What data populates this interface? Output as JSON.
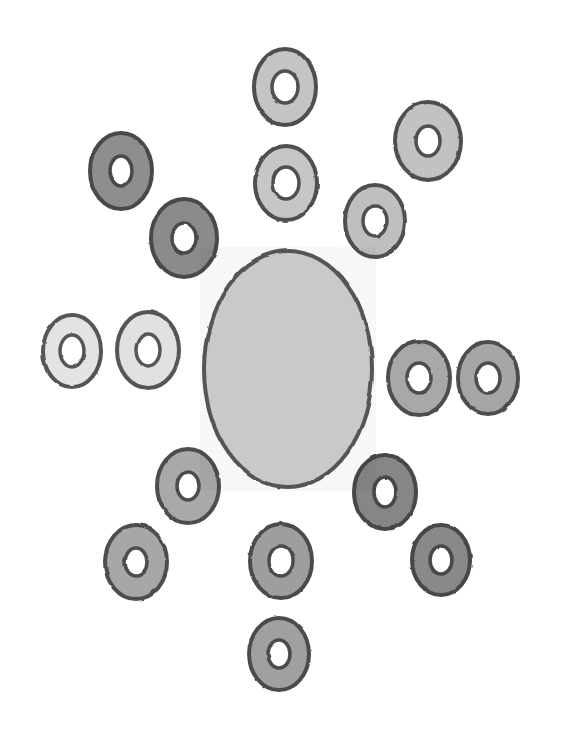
{
  "figure": {
    "medium": "hand-drawn pencil sketch",
    "background_color": "#ffffff",
    "canvas": {
      "width": 574,
      "height": 737
    },
    "stroke_color": "#5a5a5a",
    "hole_color": "#ffffff"
  },
  "chart_data": {
    "type": "scatter",
    "xlabel": "",
    "ylabel": "",
    "xlim": [
      0,
      574
    ],
    "ylim": [
      0,
      737
    ],
    "grid": false,
    "legend": "none",
    "annotations": [],
    "categories": [
      "central-disc",
      "ring-top",
      "ring-top-inner",
      "ring-upper-right-outer",
      "ring-upper-right-inner",
      "ring-upper-left-outer",
      "ring-upper-left-inner",
      "ring-left-outer",
      "ring-left-inner",
      "ring-right-inner",
      "ring-right-outer",
      "ring-lower-left-inner",
      "ring-lower-left-outer",
      "ring-bottom-inner",
      "ring-bottom-outer",
      "ring-lower-right-inner",
      "ring-lower-right-outer"
    ],
    "series": [
      {
        "name": "center_x",
        "values": [
          288,
          285,
          286,
          428,
          375,
          121,
          184,
          72,
          148,
          419,
          488,
          188,
          136,
          281,
          279,
          385,
          441
        ]
      },
      {
        "name": "center_y",
        "values": [
          369,
          87,
          183,
          141,
          221,
          171,
          238,
          351,
          350,
          378,
          378,
          486,
          562,
          561,
          654,
          492,
          560
        ]
      },
      {
        "name": "outer_radius",
        "values": [
          84,
          31,
          31,
          33,
          30,
          31,
          33,
          29,
          31,
          31,
          30,
          31,
          31,
          31,
          30,
          31,
          29
        ]
      },
      {
        "name": "hole_radius",
        "values": [
          0,
          13,
          13,
          12,
          12,
          11,
          12,
          12,
          12,
          12,
          12,
          11,
          11,
          12,
          11,
          11,
          11
        ]
      }
    ]
  },
  "shapes": {
    "core": {
      "name": "central-disc",
      "cx": 288,
      "cy": 369,
      "rx": 84,
      "ry": 118,
      "fill": "#c9c9c9",
      "stroke": "#555555",
      "stroke_width": 4
    },
    "rings": [
      {
        "name": "ring-top",
        "cx": 285,
        "cy": 87,
        "rx": 31,
        "ry": 38,
        "hole_rx": 13,
        "hole_ry": 16,
        "fill": "#c4c4c4",
        "stroke": "#4f4f4f",
        "stroke_width": 4,
        "tone": "light"
      },
      {
        "name": "ring-top-inner",
        "cx": 286,
        "cy": 183,
        "rx": 31,
        "ry": 37,
        "hole_rx": 13,
        "hole_ry": 16,
        "fill": "#c6c6c6",
        "stroke": "#4f4f4f",
        "stroke_width": 4,
        "tone": "light"
      },
      {
        "name": "ring-upper-right-outer",
        "cx": 428,
        "cy": 141,
        "rx": 33,
        "ry": 39,
        "hole_rx": 12,
        "hole_ry": 15,
        "fill": "#c2c2c2",
        "stroke": "#4f4f4f",
        "stroke_width": 4,
        "tone": "light"
      },
      {
        "name": "ring-upper-right-inner",
        "cx": 375,
        "cy": 221,
        "rx": 30,
        "ry": 36,
        "hole_rx": 12,
        "hole_ry": 15,
        "fill": "#bfbfbf",
        "stroke": "#4f4f4f",
        "stroke_width": 4,
        "tone": "light"
      },
      {
        "name": "ring-upper-left-outer",
        "cx": 121,
        "cy": 171,
        "rx": 31,
        "ry": 38,
        "hole_rx": 11,
        "hole_ry": 15,
        "fill": "#8e8e8e",
        "stroke": "#4a4a4a",
        "stroke_width": 4,
        "tone": "dark"
      },
      {
        "name": "ring-upper-left-inner",
        "cx": 184,
        "cy": 238,
        "rx": 33,
        "ry": 39,
        "hole_rx": 12,
        "hole_ry": 15,
        "fill": "#8b8b8b",
        "stroke": "#4a4a4a",
        "stroke_width": 4,
        "tone": "dark"
      },
      {
        "name": "ring-left-outer",
        "cx": 72,
        "cy": 351,
        "rx": 29,
        "ry": 36,
        "hole_rx": 12,
        "hole_ry": 16,
        "fill": "#e3e3e3",
        "stroke": "#565656",
        "stroke_width": 4,
        "tone": "very-light"
      },
      {
        "name": "ring-left-inner",
        "cx": 148,
        "cy": 350,
        "rx": 31,
        "ry": 38,
        "hole_rx": 12,
        "hole_ry": 16,
        "fill": "#e1e1e1",
        "stroke": "#565656",
        "stroke_width": 4,
        "tone": "very-light"
      },
      {
        "name": "ring-right-inner",
        "cx": 419,
        "cy": 378,
        "rx": 31,
        "ry": 37,
        "hole_rx": 12,
        "hole_ry": 15,
        "fill": "#a8a8a8",
        "stroke": "#4d4d4d",
        "stroke_width": 4,
        "tone": "medium"
      },
      {
        "name": "ring-right-outer",
        "cx": 488,
        "cy": 378,
        "rx": 30,
        "ry": 36,
        "hole_rx": 12,
        "hole_ry": 15,
        "fill": "#a6a6a6",
        "stroke": "#4d4d4d",
        "stroke_width": 4,
        "tone": "medium"
      },
      {
        "name": "ring-lower-left-inner",
        "cx": 188,
        "cy": 486,
        "rx": 31,
        "ry": 37,
        "hole_rx": 11,
        "hole_ry": 14,
        "fill": "#a9a9a9",
        "stroke": "#4d4d4d",
        "stroke_width": 4,
        "tone": "medium"
      },
      {
        "name": "ring-lower-left-outer",
        "cx": 136,
        "cy": 562,
        "rx": 31,
        "ry": 37,
        "hole_rx": 11,
        "hole_ry": 14,
        "fill": "#a7a7a7",
        "stroke": "#4d4d4d",
        "stroke_width": 4,
        "tone": "medium"
      },
      {
        "name": "ring-bottom-inner",
        "cx": 281,
        "cy": 561,
        "rx": 31,
        "ry": 37,
        "hole_rx": 12,
        "hole_ry": 15,
        "fill": "#9e9e9e",
        "stroke": "#4b4b4b",
        "stroke_width": 4,
        "tone": "medium"
      },
      {
        "name": "ring-bottom-outer",
        "cx": 279,
        "cy": 654,
        "rx": 30,
        "ry": 36,
        "hole_rx": 11,
        "hole_ry": 14,
        "fill": "#a0a0a0",
        "stroke": "#4b4b4b",
        "stroke_width": 4,
        "tone": "medium"
      },
      {
        "name": "ring-lower-right-inner",
        "cx": 385,
        "cy": 492,
        "rx": 31,
        "ry": 37,
        "hole_rx": 11,
        "hole_ry": 15,
        "fill": "#868686",
        "stroke": "#474747",
        "stroke_width": 4,
        "tone": "dark"
      },
      {
        "name": "ring-lower-right-outer",
        "cx": 441,
        "cy": 560,
        "rx": 29,
        "ry": 35,
        "hole_rx": 11,
        "hole_ry": 14,
        "fill": "#898989",
        "stroke": "#474747",
        "stroke_width": 4,
        "tone": "dark"
      }
    ]
  },
  "counts": {
    "ring_total": "16",
    "core_total": "1"
  }
}
